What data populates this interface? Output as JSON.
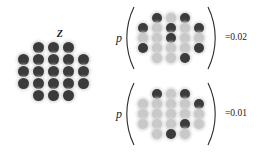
{
  "figure": {
    "background": "#ffffff",
    "node_dark_color": "#3b3b3b",
    "node_light_color": "#c9c9c9",
    "node_glow_color": "#d8d8d8"
  },
  "left_panel": {
    "label": "Z",
    "lattice": {
      "shape": "hexagonal-diamond",
      "rows": [
        [
          "dark",
          "dark",
          "dark"
        ],
        [
          "dark",
          "dark",
          "dark",
          "dark",
          "dark"
        ],
        [
          "dark",
          "dark",
          "dark",
          "dark",
          "dark"
        ],
        [
          "dark",
          "dark",
          "dark",
          "dark",
          "dark"
        ],
        [
          "dark",
          "dark",
          "dark"
        ]
      ]
    }
  },
  "expressions": [
    {
      "p_symbol": "p",
      "open_paren": "(",
      "close_paren": ")",
      "value_text": "=0.02",
      "lattice": {
        "rows": [
          [
            "dark",
            "light",
            "dark"
          ],
          [
            "dark",
            "light",
            "dark",
            "light",
            "dark"
          ],
          [
            "light",
            "light",
            "dark",
            "light",
            "light"
          ],
          [
            "dark",
            "light",
            "light",
            "light",
            "dark"
          ],
          [
            "light",
            "light",
            "dark"
          ]
        ]
      }
    },
    {
      "p_symbol": "p",
      "open_paren": "(",
      "close_paren": ")",
      "value_text": "=0.01",
      "lattice": {
        "rows": [
          [
            "dark",
            "light",
            "dark"
          ],
          [
            "light",
            "light",
            "light",
            "light",
            "dark"
          ],
          [
            "light",
            "light",
            "light",
            "light",
            "light"
          ],
          [
            "light",
            "light",
            "light",
            "dark",
            "light"
          ],
          [
            "light",
            "dark",
            "light"
          ]
        ]
      }
    }
  ]
}
